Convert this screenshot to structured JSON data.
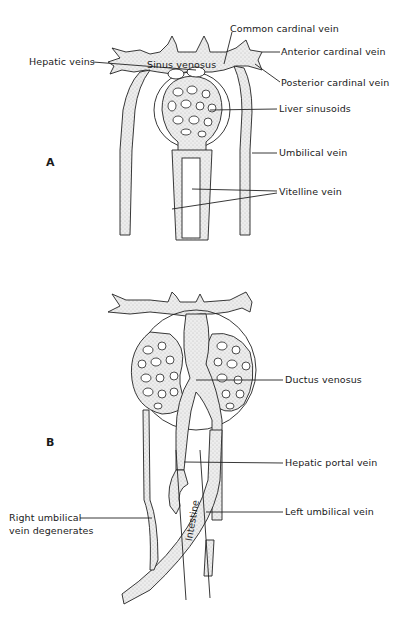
{
  "panels": {
    "a": {
      "letter": "A",
      "labels": {
        "common_cardinal_vein": "Common cardinal vein",
        "anterior_cardinal_vein": "Anterior cardinal vein",
        "sinus_venosus": "Sinus venosus",
        "posterior_cardinal_vein": "Posterior cardinal vein",
        "hepatic_veins": "Hepatic veins",
        "liver_sinusoids": "Liver sinusoids",
        "umbilical_vein": "Umbilical vein",
        "vitelline_vein": "Vitelline vein"
      }
    },
    "b": {
      "letter": "B",
      "labels": {
        "ductus_venosus": "Ductus venosus",
        "hepatic_portal_vein": "Hepatic portal vein",
        "right_umbilical_line1": "Right umbilical",
        "right_umbilical_line2": "vein degenerates",
        "left_umbilical_vein": "Left umbilical vein",
        "intestine": "Intestine"
      }
    }
  },
  "colors": {
    "ink": "#1a1a1a",
    "stipple": "#e4e4e4",
    "background": "#ffffff"
  }
}
